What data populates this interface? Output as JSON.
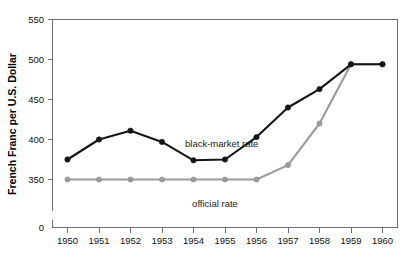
{
  "chart_data": {
    "type": "line",
    "title": "",
    "xlabel": "",
    "ylabel": "French Franc per U.S. Dollar",
    "x": [
      1950,
      1951,
      1952,
      1953,
      1954,
      1955,
      1956,
      1957,
      1958,
      1959,
      1960
    ],
    "xtick_labels": [
      "1950",
      "1951",
      "1952",
      "1953",
      "1954",
      "1955",
      "1956",
      "1957",
      "1958",
      "1959",
      "1960"
    ],
    "ytick_labels": [
      "0",
      "350",
      "400",
      "450",
      "500",
      "550"
    ],
    "ytick_values": [
      0,
      350,
      400,
      450,
      500,
      550
    ],
    "ylim": [
      350,
      550
    ],
    "y_axis_broken": true,
    "grid": false,
    "legend_position": "inline-annotation",
    "series": [
      {
        "name": "black-market rate",
        "color": "#151515",
        "marker": "filled-circle",
        "values": [
          375,
          400,
          411,
          397,
          374,
          375,
          403,
          440,
          463,
          494,
          494
        ]
      },
      {
        "name": "official rate",
        "color": "#9b9b9b",
        "marker": "filled-circle",
        "values": [
          350,
          350,
          350,
          350,
          350,
          350,
          350,
          368,
          420,
          494,
          494
        ]
      }
    ],
    "annotations": [
      {
        "text": "black-market rate",
        "x": 1955.0,
        "y": 398
      },
      {
        "text": "official rate",
        "x": 1954.9,
        "y": 337
      }
    ]
  },
  "axis": {
    "y_title": "French Franc per U.S. Dollar",
    "y_ticks": [
      {
        "label": "550",
        "value": 550
      },
      {
        "label": "500",
        "value": 500
      },
      {
        "label": "450",
        "value": 450
      },
      {
        "label": "400",
        "value": 400
      },
      {
        "label": "350",
        "value": 350
      },
      {
        "label": "0",
        "value": 0
      }
    ],
    "x_ticks": [
      {
        "label": "1950"
      },
      {
        "label": "1951"
      },
      {
        "label": "1952"
      },
      {
        "label": "1953"
      },
      {
        "label": "1954"
      },
      {
        "label": "1955"
      },
      {
        "label": "1956"
      },
      {
        "label": "1957"
      },
      {
        "label": "1958"
      },
      {
        "label": "1959"
      },
      {
        "label": "1960"
      }
    ]
  },
  "labels": {
    "black_market": "black-market rate",
    "official": "official rate"
  },
  "colors": {
    "black_series": "#151515",
    "gray_series": "#9b9b9b",
    "axis": "#6e6e6e",
    "background": "#ffffff"
  }
}
